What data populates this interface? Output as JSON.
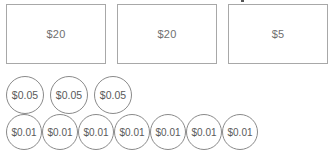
{
  "bills": [
    {
      "label": "$20",
      "value": 20
    },
    {
      "label": "$20",
      "value": 20
    },
    {
      "label": "$5",
      "value": 5
    }
  ],
  "nickels": [
    {
      "label": "$0.05",
      "value": 0.05
    },
    {
      "label": "$0.05",
      "value": 0.05
    },
    {
      "label": "$0.05",
      "value": 0.05
    }
  ],
  "pennies": [
    {
      "label": "$0.01",
      "value": 0.01
    },
    {
      "label": "$0.01",
      "value": 0.01
    },
    {
      "label": "$0.01",
      "value": 0.01
    },
    {
      "label": "$0.01",
      "value": 0.01
    },
    {
      "label": "$0.01",
      "value": 0.01
    },
    {
      "label": "$0.01",
      "value": 0.01
    },
    {
      "label": "$0.01",
      "value": 0.01
    }
  ],
  "colors": {
    "bill_border": "#a8a8a8",
    "coin_border": "#8a8a8a",
    "text": "#6f6f6f",
    "background": "#ffffff"
  }
}
